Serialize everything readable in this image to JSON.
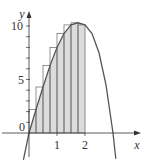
{
  "chart_data": {
    "type": "area",
    "title": "",
    "xlabel": "x",
    "ylabel": "y",
    "x_ticks": [
      "1",
      "2"
    ],
    "y_ticks": [
      "0",
      "5",
      "10"
    ],
    "xlim": [
      -0.4,
      3.6
    ],
    "ylim": [
      -3,
      12
    ],
    "grid": false,
    "legend": null,
    "curve": {
      "x": [
        -0.2,
        0,
        0.25,
        0.5,
        0.75,
        1.0,
        1.25,
        1.5,
        1.75,
        2.0,
        2.25,
        2.5,
        2.75,
        3.0,
        3.1
      ],
      "y": [
        -2.5,
        0,
        2.2,
        4.3,
        6.3,
        8.0,
        9.3,
        10.1,
        10.3,
        10.1,
        9.3,
        7.5,
        4.5,
        0.0,
        -2.4
      ]
    },
    "rectangles": {
      "x_left": [
        0,
        0.25,
        0.5,
        0.75,
        1.0,
        1.25,
        1.5,
        1.75
      ],
      "width": 0.25,
      "heights": [
        2.2,
        4.3,
        6.3,
        8.0,
        9.3,
        10.1,
        10.3,
        10.1
      ]
    },
    "shaded_region": {
      "from": 0,
      "to": 2
    }
  },
  "colors": {
    "curve": "#555555",
    "fill": "#dcdcdc",
    "axis": "#333333"
  }
}
